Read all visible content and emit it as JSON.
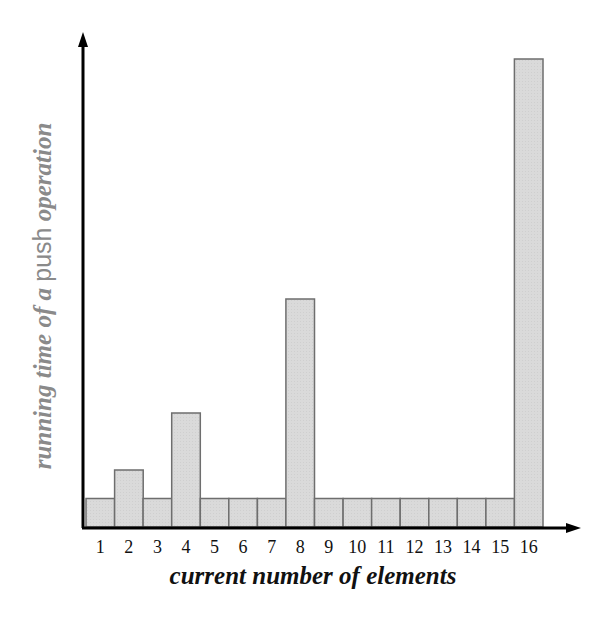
{
  "chart_data": {
    "type": "bar",
    "title": "",
    "xlabel": "current number of elements",
    "ylabel": "running time of a push operation",
    "ylabel_parts": [
      {
        "text": "running time of a ",
        "style": "italic"
      },
      {
        "text": "push",
        "style": "plain"
      },
      {
        "text": " operation",
        "style": "italic"
      }
    ],
    "categories": [
      "1",
      "2",
      "3",
      "4",
      "5",
      "6",
      "7",
      "8",
      "9",
      "10",
      "11",
      "12",
      "13",
      "14",
      "15",
      "16"
    ],
    "values": [
      1,
      2,
      1,
      4,
      1,
      1,
      1,
      8,
      1,
      1,
      1,
      1,
      1,
      1,
      1,
      16
    ],
    "ylim": [
      0,
      17
    ],
    "grid": false,
    "legend": null,
    "y_ticks": "none",
    "bar_fill": "#d9d9d9",
    "bar_edge": "#6e6e6e",
    "axis_color": "#000000"
  }
}
